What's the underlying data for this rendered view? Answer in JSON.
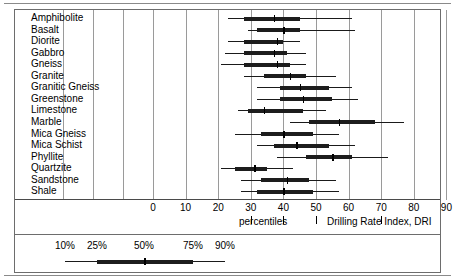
{
  "chart_data": {
    "type": "box",
    "title": "",
    "xlabel": "Drilling Rate Index, DRI",
    "ylabel": "",
    "xlim": [
      -7,
      96
    ],
    "grid": true,
    "legend_position": "bottom",
    "xticks": [
      0,
      10,
      20,
      30,
      40,
      50,
      60,
      70,
      80,
      90
    ],
    "xticklabels": [
      "0",
      "10",
      "20",
      "30",
      "40",
      "50",
      "60",
      "70",
      "80",
      "90"
    ],
    "percentile_levels": [
      "10%",
      "25%",
      "50%",
      "75%",
      "90%"
    ],
    "percentiles_caption": "percentiles",
    "axis_caption": "Drilling Rate Index, DRI",
    "categories": [
      "Amphibolite",
      "Basalt",
      "Diorite",
      "Gabbro",
      "Gneiss",
      "Granite",
      "Granitic Gneiss",
      "Greenstone",
      "Limestone",
      "Marble",
      "Mica Gneiss",
      "Mica Schist",
      "Phyllite",
      "Quartzite",
      "Sandstone",
      "Shale"
    ],
    "series": [
      {
        "name": "Amphibolite",
        "p10": 23,
        "p25": 28,
        "p50": 37,
        "p75": 45,
        "p90": 61
      },
      {
        "name": "Basalt",
        "p10": 29,
        "p25": 32,
        "p50": 40,
        "p75": 45,
        "p90": 62
      },
      {
        "name": "Diorite",
        "p10": 23,
        "p25": 28,
        "p50": 38,
        "p75": 40,
        "p90": 45
      },
      {
        "name": "Gabbro",
        "p10": 22,
        "p25": 28,
        "p50": 37,
        "p75": 41,
        "p90": 47
      },
      {
        "name": "Gneiss",
        "p10": 21,
        "p25": 28,
        "p50": 38,
        "p75": 42,
        "p90": 47
      },
      {
        "name": "Granite",
        "p10": 28,
        "p25": 34,
        "p50": 42,
        "p75": 47,
        "p90": 56
      },
      {
        "name": "Granitic Gneiss",
        "p10": 32,
        "p25": 39,
        "p50": 45,
        "p75": 54,
        "p90": 61
      },
      {
        "name": "Greenstone",
        "p10": 32,
        "p25": 39,
        "p50": 46,
        "p75": 55,
        "p90": 63
      },
      {
        "name": "Limestone",
        "p10": 26,
        "p25": 29,
        "p50": 34,
        "p75": 46,
        "p90": 53
      },
      {
        "name": "Marble",
        "p10": 42,
        "p25": 48,
        "p50": 57,
        "p75": 68,
        "p90": 77
      },
      {
        "name": "Mica Gneiss",
        "p10": 25,
        "p25": 33,
        "p50": 40,
        "p75": 49,
        "p90": 57
      },
      {
        "name": "Mica Schist",
        "p10": 32,
        "p25": 37,
        "p50": 44,
        "p75": 54,
        "p90": 62
      },
      {
        "name": "Phyllite",
        "p10": 38,
        "p25": 47,
        "p50": 55,
        "p75": 61,
        "p90": 72
      },
      {
        "name": "Quartzite",
        "p10": 21,
        "p25": 25,
        "p50": 31,
        "p75": 35,
        "p90": 43
      },
      {
        "name": "Sandstone",
        "p10": 27,
        "p25": 33,
        "p50": 41,
        "p75": 48,
        "p90": 56
      },
      {
        "name": "Shale",
        "p10": 27,
        "p25": 32,
        "p50": 40,
        "p75": 49,
        "p90": 57
      }
    ]
  },
  "colors": {
    "frame": "#6d6d6d",
    "gridline": "#9a9a9a",
    "marker": "#1d1d1d",
    "background": "#ffffff"
  }
}
